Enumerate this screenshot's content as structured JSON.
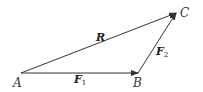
{
  "diagram": {
    "type": "vector-triangle",
    "points": {
      "A": {
        "label": "A",
        "x": 21,
        "y": 73
      },
      "B": {
        "label": "B",
        "x": 138,
        "y": 73
      },
      "C": {
        "label": "C",
        "x": 176,
        "y": 13
      }
    },
    "vectors": [
      {
        "name": "F1",
        "from": "A",
        "to": "B",
        "label": "F",
        "subscript": "1"
      },
      {
        "name": "F2",
        "from": "B",
        "to": "C",
        "label": "F",
        "subscript": "2"
      },
      {
        "name": "R",
        "from": "A",
        "to": "C",
        "label": "R",
        "subscript": ""
      }
    ],
    "colors": {
      "stroke": "#333333",
      "text": "#222222"
    }
  }
}
